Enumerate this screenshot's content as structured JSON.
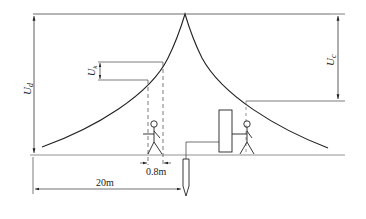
{
  "diagram": {
    "labels": {
      "ud": {
        "main": "U",
        "sub": "d"
      },
      "uk": {
        "main": "U",
        "sub": "k"
      },
      "uc": {
        "main": "U",
        "sub": "c"
      },
      "step_distance": "0.8m",
      "total_distance": "20m"
    },
    "colors": {
      "line": "#222222",
      "ground": "#888888"
    },
    "elements": [
      "potential-curve",
      "step-voltage-person",
      "touch-voltage-person",
      "electrical-device",
      "grounding-electrode"
    ]
  }
}
